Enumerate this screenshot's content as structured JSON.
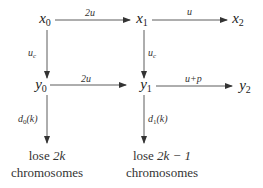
{
  "diagram": {
    "nodes": {
      "x0": {
        "base": "x",
        "sub": "0"
      },
      "x1": {
        "base": "x",
        "sub": "1"
      },
      "x2": {
        "base": "x",
        "sub": "2"
      },
      "y0": {
        "base": "y",
        "sub": "0"
      },
      "y1": {
        "base": "y",
        "sub": "1"
      },
      "y2": {
        "base": "y",
        "sub": "2"
      }
    },
    "edges": {
      "x0_x1": {
        "label": "2u"
      },
      "x1_x2": {
        "label": "u"
      },
      "y0_y1": {
        "label": "2u"
      },
      "y1_y2": {
        "label": "u+p"
      },
      "x0_y0": {
        "label_base": "u",
        "label_sub": "c"
      },
      "x1_y1": {
        "label_base": "u",
        "label_sub": "c"
      },
      "y0_out": {
        "label_base": "d",
        "label_sub": "0",
        "label_arg": "(k)"
      },
      "y1_out": {
        "label_base": "d",
        "label_sub": "1",
        "label_arg": "(k)"
      }
    },
    "outcomes": {
      "left": {
        "prefix": "lose ",
        "math": "2k",
        "line2": "chromosomes"
      },
      "right": {
        "prefix": "lose ",
        "math": "2k − 1",
        "line2": "chromosomes"
      }
    },
    "colors": {
      "line": "#333333",
      "text": "#222222",
      "background": "#ffffff"
    }
  }
}
